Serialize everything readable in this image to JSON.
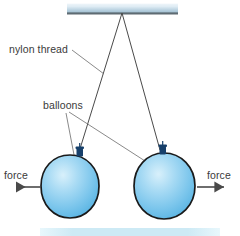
{
  "diagram": {
    "canvas": {
      "width": 240,
      "height": 236,
      "background": "#ffffff"
    },
    "labels": {
      "nylon_thread": "nylon thread",
      "balloons": "balloons",
      "force_left": "force",
      "force_right": "force"
    },
    "colors": {
      "label_text": "#3a3a3a",
      "leader_line": "#6b6b6b",
      "thread": "#4a4a4a",
      "balloon_outline": "#1a1a1a",
      "balloon_fill_light": "#bfe4f7",
      "balloon_fill_mid": "#7fc8ec",
      "balloon_fill_deep": "#5fb8e4",
      "knot": "#17406b",
      "arrow": "#4a4a4a",
      "ceiling_light": "#e8f1f7",
      "ceiling_mid": "#b9d2e2",
      "ceiling_edge": "#5e6b72",
      "floor_strip": "#cdeaf5"
    },
    "ceiling": {
      "name": "ceiling-support-bar",
      "x": 67,
      "y": 3,
      "width": 111,
      "height": 10
    },
    "floor_strip": {
      "name": "floor-strip",
      "x": 40,
      "y": 228,
      "width": 180,
      "height": 8
    },
    "anchor_point": {
      "x": 122,
      "y": 13
    },
    "threads": [
      {
        "name": "thread-left",
        "x1": 122,
        "y1": 13,
        "x2": 79,
        "y2": 152
      },
      {
        "name": "thread-right",
        "x1": 122,
        "y1": 13,
        "x2": 160,
        "y2": 150
      }
    ],
    "balloons": [
      {
        "name": "balloon-left",
        "cx": 70,
        "cy": 186,
        "rx": 29,
        "ry": 31,
        "knot": {
          "x": 77,
          "y": 148,
          "width": 7,
          "height": 9
        }
      },
      {
        "name": "balloon-right",
        "cx": 165,
        "cy": 186,
        "rx": 30,
        "ry": 32,
        "knot": {
          "x": 160,
          "y": 146,
          "width": 7,
          "height": 9
        }
      }
    ],
    "force_arrows": [
      {
        "name": "force-arrow-left",
        "direction": "left",
        "x1": 41,
        "y1": 187,
        "x2": 14,
        "y2": 187
      },
      {
        "name": "force-arrow-right",
        "direction": "right",
        "x1": 197,
        "y1": 187,
        "x2": 226,
        "y2": 187
      }
    ],
    "leaders": {
      "nylon_thread": {
        "x1": 72,
        "y1": 50,
        "x2": 103,
        "y2": 73
      },
      "balloons_left": {
        "x1": 66,
        "y1": 113,
        "x2": 79,
        "y2": 180
      },
      "balloons_right": {
        "x1": 69,
        "y1": 112,
        "x2": 172,
        "y2": 178
      }
    }
  }
}
